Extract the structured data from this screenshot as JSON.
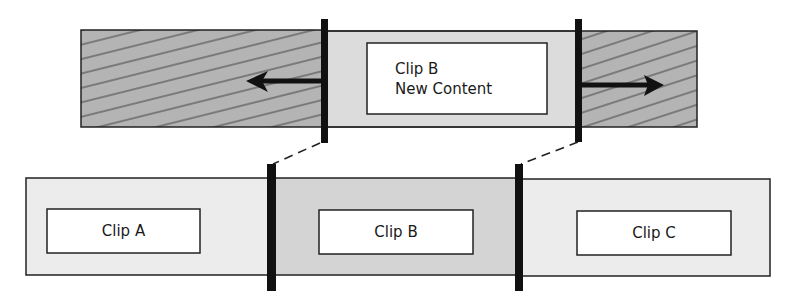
{
  "diagram": {
    "type": "video-editing-overwrite-edit",
    "colors": {
      "hatched_fill": "#b2b2b2",
      "hatch_line": "#2a2a2a",
      "new_clip_fill": "#dcdcdc",
      "timeline_light_fill": "#ececec",
      "timeline_mid_fill": "#d2d2d2",
      "handle": "#111111",
      "box_fill": "#ffffff",
      "stroke": "#222222"
    },
    "source_track": {
      "left_extension": {
        "pattern": "hatched",
        "arrow_direction": "left"
      },
      "clip": {
        "title": "Clip B",
        "subtitle": "New Content"
      },
      "right_extension": {
        "pattern": "hatched",
        "arrow_direction": "right"
      }
    },
    "timeline_track": {
      "clips": [
        {
          "label": "Clip A"
        },
        {
          "label": "Clip B"
        },
        {
          "label": "Clip C"
        }
      ]
    },
    "connectors": {
      "style": "dashed",
      "count": 2
    }
  }
}
